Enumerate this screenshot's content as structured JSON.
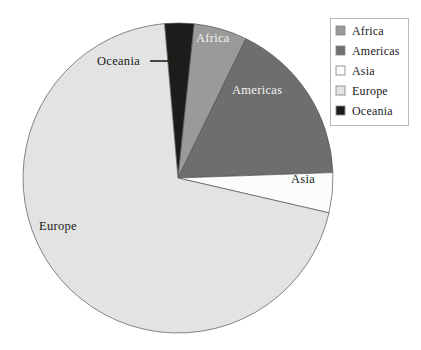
{
  "chart_data": {
    "type": "pie",
    "title": "",
    "categories": [
      "Africa",
      "Americas",
      "Asia",
      "Europe",
      "Oceania"
    ],
    "values": [
      5.6,
      17.2,
      4.2,
      70.1,
      2.9
    ],
    "unit": "percent",
    "start_angle_deg": -95,
    "direction": "clockwise",
    "colors": {
      "Africa": "#9a9a9a",
      "Americas": "#6e6e6e",
      "Asia": "#fcfcfc",
      "Europe": "#e3e3e3",
      "Oceania": "#1c1c1c"
    },
    "slices": [
      {
        "name": "Oceania",
        "value": 2.9,
        "color": "#1c1c1c",
        "start_deg": -95.0,
        "end_deg": -84.0
      },
      {
        "name": "Africa",
        "value": 5.6,
        "color": "#9a9a9a",
        "start_deg": -84.0,
        "end_deg": -64.0
      },
      {
        "name": "Americas",
        "value": 17.2,
        "color": "#6e6e6e",
        "start_deg": -64.0,
        "end_deg": -2.0
      },
      {
        "name": "Asia",
        "value": 4.2,
        "color": "#fcfcfc",
        "start_deg": -2.0,
        "end_deg": 13.0
      },
      {
        "name": "Europe",
        "value": 70.1,
        "color": "#e3e3e3",
        "start_deg": 13.0,
        "end_deg": 265.0
      }
    ],
    "legend": {
      "position": "top-right",
      "entries": [
        {
          "label": "Africa",
          "color": "#9a9a9a"
        },
        {
          "label": "Americas",
          "color": "#6e6e6e"
        },
        {
          "label": "Asia",
          "color": "#fcfcfc"
        },
        {
          "label": "Europe",
          "color": "#e3e3e3"
        },
        {
          "label": "Oceania",
          "color": "#1c1c1c"
        }
      ]
    },
    "annotations": [
      {
        "text": "Oceania",
        "kind": "callout-arrow",
        "points_to": "Oceania"
      }
    ],
    "grid": false,
    "xlabel": "",
    "ylabel": ""
  },
  "labels": {
    "africa": "Africa",
    "americas": "Americas",
    "asia": "Asia",
    "europe": "Europe",
    "oceania_callout": "Oceania"
  },
  "legend": {
    "item0": "Africa",
    "item1": "Americas",
    "item2": "Asia",
    "item3": "Europe",
    "item4": "Oceania"
  }
}
